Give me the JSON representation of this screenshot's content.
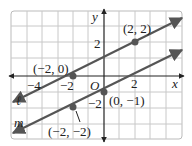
{
  "graph": {
    "x_axis_label": "x",
    "y_axis_label": "y",
    "origin_label": "O",
    "x_ticks": [
      {
        "value": -4,
        "label": "−4"
      },
      {
        "value": -2,
        "label": "−2"
      },
      {
        "value": 2,
        "label": "2"
      }
    ],
    "y_ticks": [
      {
        "value": 2,
        "label": "2"
      },
      {
        "value": -2,
        "label": "−2"
      }
    ],
    "lines": [
      {
        "name": "ℓ",
        "points": [
          [
            -2,
            0
          ],
          [
            2,
            2
          ]
        ]
      },
      {
        "name": "m",
        "points": [
          [
            -2,
            -2
          ],
          [
            0,
            -1
          ]
        ]
      }
    ],
    "points": [
      {
        "label": "(2, 2)",
        "x": 2,
        "y": 2
      },
      {
        "label": "(−2, 0)",
        "x": -2,
        "y": 0
      },
      {
        "label": "(0, −1)",
        "x": 0,
        "y": -1
      },
      {
        "label": "(−2, −2)",
        "x": -2,
        "y": -2
      }
    ],
    "colors": {
      "grid": "#c8c8c8",
      "line": "#555555",
      "axis": "#222222",
      "frame": "#bbbbbb"
    }
  }
}
